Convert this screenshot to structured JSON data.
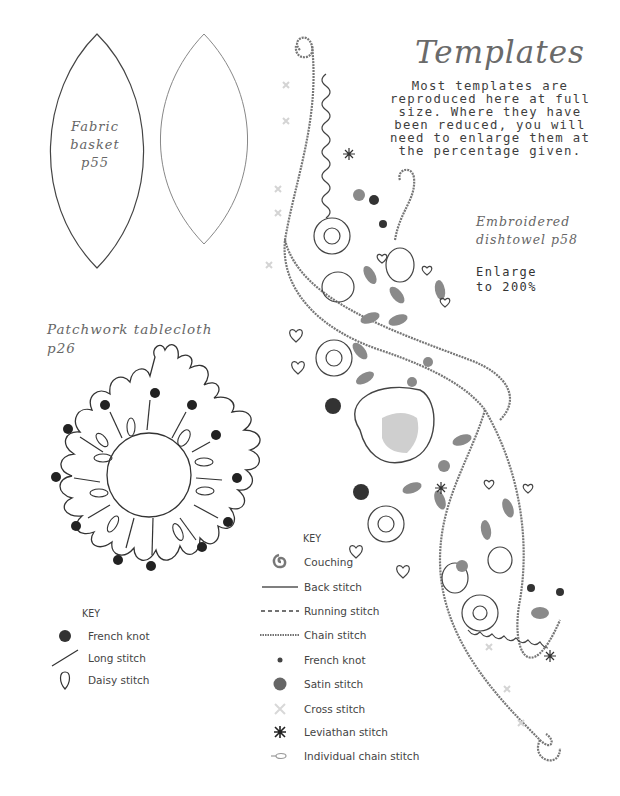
{
  "page": {
    "title": "Templates",
    "intro": "Most templates are\nreproduced here at full\nsize. Where they have\nbeen reduced, you will\nneed to enlarge them at\nthe percentage given."
  },
  "templates": {
    "fabric_basket": {
      "label": "Fabric\nbasket\np55"
    },
    "patchwork_tablecloth": {
      "label": "Patchwork tablecloth\np26"
    },
    "embroidered_dishtowel": {
      "label": "Embroidered\ndishtowel p58",
      "note": "Enlarge\nto 200%"
    }
  },
  "key_tablecloth": {
    "title": "KEY",
    "items": [
      {
        "symbol": "filled-dot-icon",
        "label": "French knot"
      },
      {
        "symbol": "diagonal-line-icon",
        "label": "Long stitch"
      },
      {
        "symbol": "teardrop-outline-icon",
        "label": "Daisy stitch"
      }
    ]
  },
  "key_dishtowel": {
    "title": "KEY",
    "items": [
      {
        "symbol": "spiral-icon",
        "label": "Couching"
      },
      {
        "symbol": "solid-line-icon",
        "label": "Back stitch"
      },
      {
        "symbol": "dashed-line-icon",
        "label": "Running stitch"
      },
      {
        "symbol": "dotted-line-icon",
        "label": "Chain stitch"
      },
      {
        "symbol": "small-dot-icon",
        "label": "French knot"
      },
      {
        "symbol": "large-dot-icon",
        "label": "Satin stitch"
      },
      {
        "symbol": "cross-icon",
        "label": "Cross stitch"
      },
      {
        "symbol": "asterisk-icon",
        "label": "Leviathan stitch"
      },
      {
        "symbol": "chain-loop-icon",
        "label": "Individual chain stitch"
      }
    ]
  },
  "colors": {
    "line_dark": "#333333",
    "line_mid": "#777777",
    "fill_gray": "#8a8a8a",
    "cross_light": "#d4d4d4",
    "satin_light": "#c8c8c8"
  }
}
